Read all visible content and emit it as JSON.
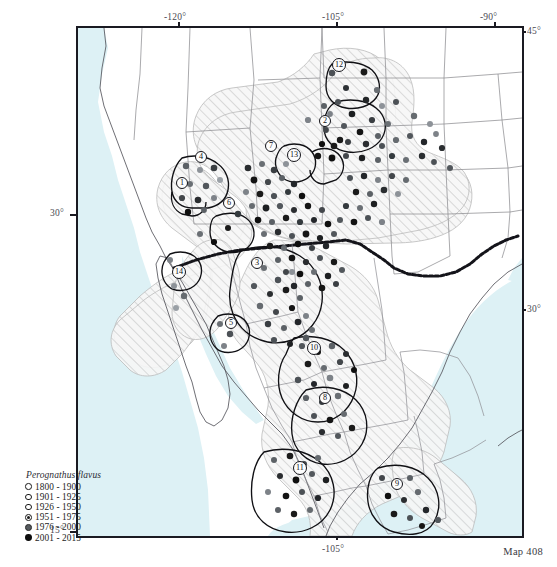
{
  "figure": {
    "credit": "Map 408",
    "frame": {
      "left": 76,
      "top": 26,
      "width": 448,
      "height": 512
    }
  },
  "legend": {
    "title": "Perognathus flavus",
    "entries": [
      {
        "label": "1800 - 1900",
        "symbol": "open-circle",
        "fill": "#ffffff",
        "stroke": "#1a1a1a"
      },
      {
        "label": "1901 - 1925",
        "symbol": "open-circle",
        "fill": "#ffffff",
        "stroke": "#1a1a1a"
      },
      {
        "label": "1926 - 1950",
        "symbol": "open-circle",
        "fill": "#ffffff",
        "stroke": "#1a1a1a"
      },
      {
        "label": "1951 - 1975",
        "symbol": "dotted-circle",
        "fill": "#ffffff",
        "stroke": "#141414"
      },
      {
        "label": "1976 - 2000",
        "symbol": "gray-filled-circle",
        "fill": "#555a5e",
        "stroke": "#2a2a2a"
      },
      {
        "label": "2001 - 2015",
        "symbol": "black-filled-circle",
        "fill": "#0d0d0d",
        "stroke": "#0d0d0d"
      }
    ]
  },
  "graticule": {
    "top_labels": [
      {
        "text": "-120°",
        "x": 178
      },
      {
        "text": "-105°",
        "x": 336
      },
      {
        "text": "-90°",
        "x": 494
      }
    ],
    "bottom_labels": [
      {
        "text": "-105°",
        "x": 336
      }
    ],
    "left_labels": [
      {
        "text": "30°",
        "y": 214
      },
      {
        "text": "15°",
        "y": 531
      }
    ],
    "right_labels": [
      {
        "text": "45°",
        "y": 31
      },
      {
        "text": "30°",
        "y": 309
      }
    ]
  },
  "colors": {
    "ocean": "#ddf1f5",
    "land": "#ffffff",
    "range_hatch_bg": "#f7f7f7",
    "range_hatch_line": "#c9c9c9",
    "state_border": "#8d8d92",
    "country_border": "#15151a",
    "frame": "#1a1a22",
    "subregion_border": "#101014"
  },
  "regions": [
    {
      "id": 1,
      "x": 182,
      "y": 183
    },
    {
      "id": 2,
      "x": 325,
      "y": 121
    },
    {
      "id": 3,
      "x": 257,
      "y": 263
    },
    {
      "id": 4,
      "x": 201,
      "y": 157
    },
    {
      "id": 5,
      "x": 231,
      "y": 323
    },
    {
      "id": 6,
      "x": 229,
      "y": 203
    },
    {
      "id": 7,
      "x": 271,
      "y": 146
    },
    {
      "id": 8,
      "x": 325,
      "y": 398
    },
    {
      "id": 9,
      "x": 397,
      "y": 484
    },
    {
      "id": 10,
      "x": 314,
      "y": 348
    },
    {
      "id": 11,
      "x": 300,
      "y": 468
    },
    {
      "id": 12,
      "x": 339,
      "y": 65
    },
    {
      "id": 13,
      "x": 294,
      "y": 155
    },
    {
      "id": 14,
      "x": 179,
      "y": 272
    }
  ],
  "chart_data": {
    "type": "scatter",
    "xlabel": "Longitude",
    "ylabel": "Latitude",
    "xlim": [
      -125,
      -88
    ],
    "ylim": [
      14,
      45.5
    ],
    "grid": false,
    "legend_position": "bottom-left",
    "series": [
      {
        "name": "1800 - 1900",
        "color": "#ffffff",
        "values": []
      },
      {
        "name": "1901 - 1925",
        "color": "#ffffff",
        "values": []
      },
      {
        "name": "1926 - 1950",
        "color": "#ffffff",
        "values": []
      },
      {
        "name": "1951 - 1975",
        "color": "#ffffff",
        "values": []
      },
      {
        "name": "1976 - 2000",
        "color": "#555a5e",
        "values": []
      },
      {
        "name": "2001 - 2015",
        "color": "#0d0d0d",
        "values": []
      }
    ],
    "annotations": [
      "14 numbered subspecies/population regions outlined within the shaded range",
      "Shaded hatched polygon = mapped species range across SW United States and Mexico"
    ]
  }
}
